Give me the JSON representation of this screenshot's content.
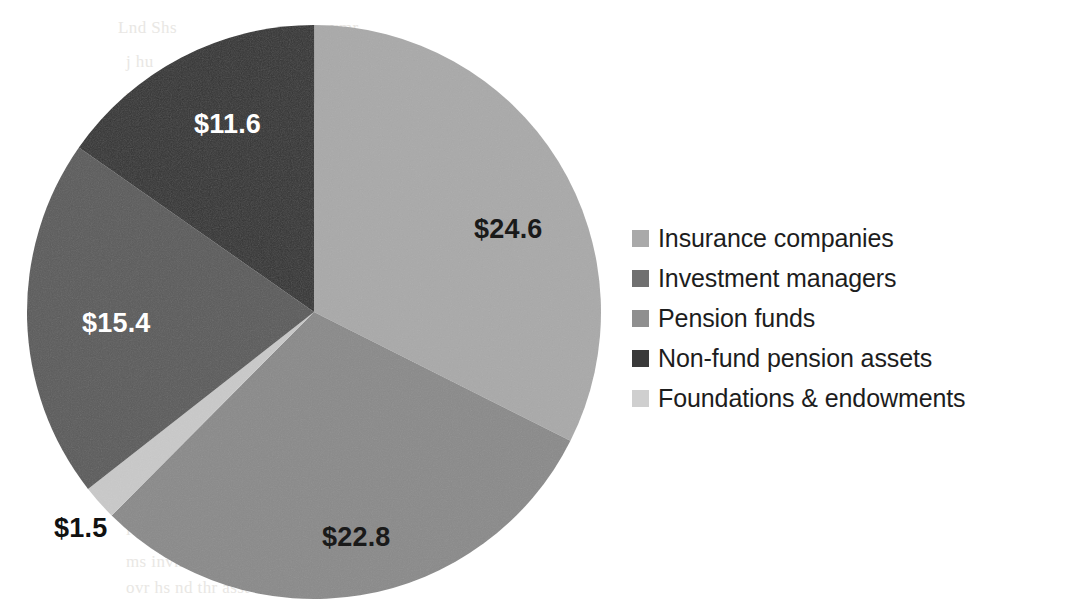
{
  "chart_data": {
    "type": "pie",
    "title": "",
    "subtitle": "",
    "xlabel": "",
    "ylabel": "",
    "unit_prefix": "$",
    "total": 75.9,
    "start_angle_deg": 0,
    "direction": "clockwise",
    "legend_position": "right",
    "grid": false,
    "categories": [
      "Insurance companies",
      "Investment managers",
      "Pension funds",
      "Non-fund pension assets",
      "Foundations & endowments"
    ],
    "values": [
      24.6,
      22.8,
      15.4,
      11.6,
      1.5
    ],
    "data_labels": [
      "$24.6",
      "$22.8",
      "$15.4",
      "$11.6",
      "$1.5"
    ],
    "colors": [
      "#a9a9a9",
      "#8a8a8a",
      "#5b5b5b",
      "#333333",
      "#c9c9c9"
    ],
    "slices": [
      {
        "name": "Insurance companies",
        "value": 24.6,
        "label": "$24.6",
        "color": "#a9a9a9",
        "start_deg": 0.0,
        "sweep_deg": 116.68,
        "label_color": "#1a1a1a",
        "label_placement": "inside"
      },
      {
        "name": "Investment managers",
        "value": 22.8,
        "label": "$22.8",
        "color": "#8a8a8a",
        "start_deg": 116.68,
        "sweep_deg": 108.15,
        "label_color": "#1a1a1a",
        "label_placement": "inside"
      },
      {
        "name": "Pension funds",
        "value": 15.4,
        "label": "$15.4",
        "color": "#5b5b5b",
        "start_deg": 231.94,
        "sweep_deg": 73.05,
        "label_color": "#ffffff",
        "label_placement": "inside"
      },
      {
        "name": "Non-fund pension assets",
        "value": 11.6,
        "label": "$11.6",
        "color": "#333333",
        "start_deg": 304.99,
        "sweep_deg": 55.02,
        "label_color": "#ffffff",
        "label_placement": "inside"
      },
      {
        "name": "Foundations & endowments",
        "value": 1.5,
        "label": "$1.5",
        "color": "#c9c9c9",
        "start_deg": 224.83,
        "sweep_deg": 7.11,
        "label_color": "#111111",
        "label_placement": "outside"
      }
    ]
  },
  "legend": {
    "items": [
      {
        "label": "Insurance companies",
        "color": "#a9a9a9"
      },
      {
        "label": "Investment managers",
        "color": "#707070"
      },
      {
        "label": "Pension funds",
        "color": "#8f8f8f"
      },
      {
        "label": "Non-fund pension assets",
        "color": "#3a3a3a"
      },
      {
        "label": "Foundations & endowments",
        "color": "#cfcfcf"
      }
    ]
  },
  "labels": {
    "slice_0": "$24.6",
    "slice_1": "$22.8",
    "slice_2": "$15.4",
    "slice_3": "$11.6",
    "slice_4": "$1.5"
  },
  "background": {
    "page_color": "#ffffff",
    "bleed_text": [
      "Lnd Shs",
      "ymr",
      "j hu",
      "mlv",
      "ic aty",
      "ms invntm",
      "ovr hs nd thr asst"
    ]
  }
}
